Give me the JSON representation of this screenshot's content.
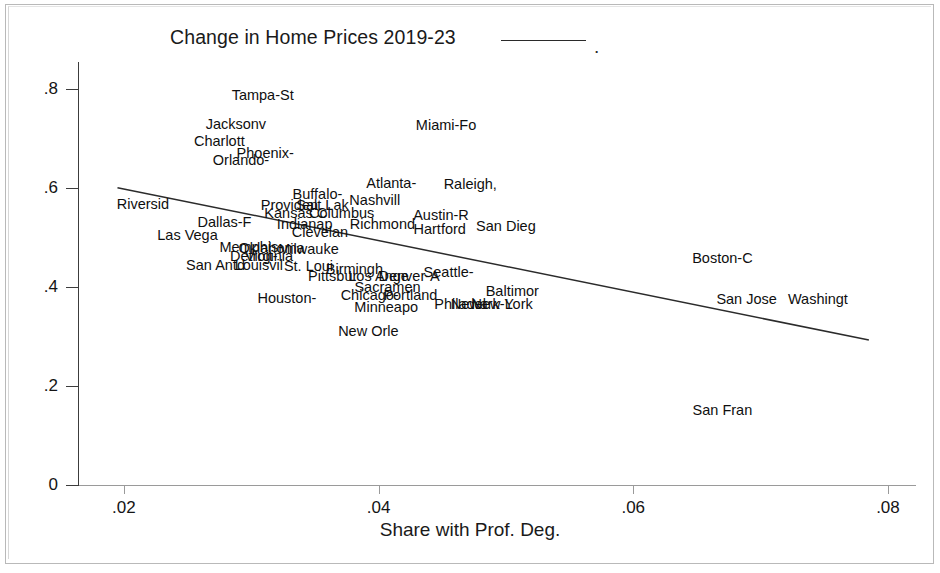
{
  "chart_data": {
    "type": "scatter",
    "title": "Change in Home Prices 2019-23",
    "title_suffix": ".",
    "xlabel": "Share with Prof. Deg.",
    "ylabel": "",
    "xlim": [
      0.0164,
      0.0822
    ],
    "ylim": [
      0.0,
      0.855
    ],
    "xticks": [
      0.02,
      0.04,
      0.06,
      0.08
    ],
    "xtick_labels": [
      ".02",
      ".04",
      ".06",
      ".08"
    ],
    "yticks": [
      0.0,
      0.2,
      0.4,
      0.6,
      0.8
    ],
    "ytick_labels": [
      "0",
      ".2",
      ".4",
      ".6",
      ".8"
    ],
    "grid": false,
    "legend": "none",
    "marker_style": "text-label",
    "fit_line": {
      "label": "fitted values",
      "x": [
        0.0195,
        0.0785
      ],
      "y": [
        0.601,
        0.293
      ],
      "color": "#2b2b2b"
    },
    "points": [
      {
        "label": "Tampa-St",
        "x": 0.0309,
        "y": 0.788
      },
      {
        "label": "Jacksonv",
        "x": 0.0288,
        "y": 0.73
      },
      {
        "label": "Miami-Fo",
        "x": 0.0453,
        "y": 0.728
      },
      {
        "label": "Charlott",
        "x": 0.0275,
        "y": 0.695
      },
      {
        "label": "Phoenix-",
        "x": 0.0311,
        "y": 0.672
      },
      {
        "label": "Orlando-",
        "x": 0.0292,
        "y": 0.656
      },
      {
        "label": "Atlanta-",
        "x": 0.041,
        "y": 0.61
      },
      {
        "label": "Raleigh,",
        "x": 0.0472,
        "y": 0.608
      },
      {
        "label": "Buffalo-",
        "x": 0.0352,
        "y": 0.588
      },
      {
        "label": "Nashvill",
        "x": 0.0397,
        "y": 0.576
      },
      {
        "label": "Riversid",
        "x": 0.0215,
        "y": 0.568
      },
      {
        "label": "Providen",
        "x": 0.033,
        "y": 0.566
      },
      {
        "label": "Salt Lak",
        "x": 0.0356,
        "y": 0.566
      },
      {
        "label": "Kansas C",
        "x": 0.0335,
        "y": 0.549
      },
      {
        "label": "Columbus",
        "x": 0.0371,
        "y": 0.549
      },
      {
        "label": "Austin-R",
        "x": 0.0449,
        "y": 0.545
      },
      {
        "label": "Dallas-F",
        "x": 0.0279,
        "y": 0.531
      },
      {
        "label": "Indianap",
        "x": 0.0342,
        "y": 0.527
      },
      {
        "label": "Richmond",
        "x": 0.0403,
        "y": 0.527
      },
      {
        "label": "San Dieg",
        "x": 0.05,
        "y": 0.524
      },
      {
        "label": "Hartford",
        "x": 0.0448,
        "y": 0.518
      },
      {
        "label": "Clevelan",
        "x": 0.0354,
        "y": 0.512
      },
      {
        "label": "Las Vega",
        "x": 0.025,
        "y": 0.506
      },
      {
        "label": "Memphis-",
        "x": 0.03,
        "y": 0.482
      },
      {
        "label": "Oklahoma",
        "x": 0.0316,
        "y": 0.479
      },
      {
        "label": "Milwauke",
        "x": 0.0345,
        "y": 0.477
      },
      {
        "label": "Detroit-",
        "x": 0.0302,
        "y": 0.463
      },
      {
        "label": "Virginia",
        "x": 0.0314,
        "y": 0.462
      },
      {
        "label": "Boston-C",
        "x": 0.067,
        "y": 0.458
      },
      {
        "label": "San Antd",
        "x": 0.0272,
        "y": 0.444
      },
      {
        "label": "Louisvil",
        "x": 0.0306,
        "y": 0.444
      },
      {
        "label": "St. Loui",
        "x": 0.0345,
        "y": 0.442
      },
      {
        "label": "Birmingh",
        "x": 0.0381,
        "y": 0.437
      },
      {
        "label": "Seattle-",
        "x": 0.0455,
        "y": 0.431
      },
      {
        "label": "Pittsbur",
        "x": 0.0364,
        "y": 0.422
      },
      {
        "label": "Los Ange",
        "x": 0.04,
        "y": 0.422
      },
      {
        "label": "Denver-A",
        "x": 0.0424,
        "y": 0.422
      },
      {
        "label": "San Fran",
        "x": 0.067,
        "y": 0.152
      },
      {
        "label": "Sacramen",
        "x": 0.0407,
        "y": 0.4
      },
      {
        "label": "Baltimor",
        "x": 0.0505,
        "y": 0.392
      },
      {
        "label": "Chicago-",
        "x": 0.0393,
        "y": 0.385
      },
      {
        "label": "Portland",
        "x": 0.0425,
        "y": 0.385
      },
      {
        "label": "Houston-",
        "x": 0.0328,
        "y": 0.378
      },
      {
        "label": "Minneapo",
        "x": 0.0406,
        "y": 0.359
      },
      {
        "label": "Philadel",
        "x": 0.0464,
        "y": 0.366
      },
      {
        "label": "Newark-L",
        "x": 0.0481,
        "y": 0.366
      },
      {
        "label": "New York",
        "x": 0.0497,
        "y": 0.366
      },
      {
        "label": "San Jose",
        "x": 0.0689,
        "y": 0.375
      },
      {
        "label": "Washingt",
        "x": 0.0745,
        "y": 0.375
      },
      {
        "label": "New Orle",
        "x": 0.0392,
        "y": 0.312
      }
    ]
  }
}
